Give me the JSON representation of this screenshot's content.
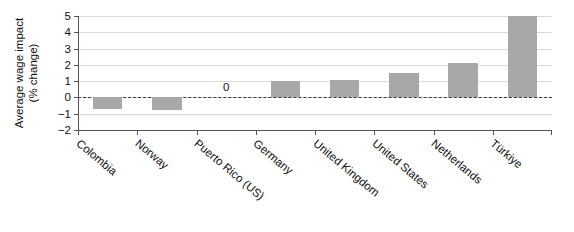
{
  "chart_data": {
    "type": "bar",
    "title": "",
    "subtitle": "",
    "xlabel": "",
    "ylabel_lines": [
      "Average wage impact",
      "(% change)"
    ],
    "ylabel": "Average wage impact (% change)",
    "categories": [
      "Colombia",
      "Norway",
      "Puerto Rico (US)",
      "Germany",
      "United Kingdom",
      "United States",
      "Netherlands",
      "Türkiye"
    ],
    "values": [
      -0.7,
      -0.75,
      0,
      1.0,
      1.1,
      1.5,
      2.1,
      5.0
    ],
    "point_labels": [
      "",
      "",
      "0",
      "",
      "",
      "",
      "",
      ""
    ],
    "ylim": [
      -2,
      5
    ],
    "yticks": [
      5,
      4,
      3,
      2,
      1,
      0,
      -1,
      -2
    ],
    "ytick_labels": [
      "5",
      "4",
      "3",
      "2",
      "1",
      "0",
      "-1",
      "-2"
    ],
    "grid": true,
    "grid_axis": "y",
    "legend": false,
    "legend_position": "none",
    "zero_line": true,
    "bar_color": "#a8a8a8",
    "grid_color": "#d9d9d9",
    "axis_color": "#555555",
    "zero_line_color": "#3a3a3a",
    "text_color": "#111111",
    "xlabel_rotation_deg": 40
  }
}
